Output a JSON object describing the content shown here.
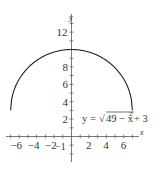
{
  "chart_data": {
    "type": "line",
    "title": "",
    "xlabel": "x",
    "ylabel": "y",
    "equation": "y = √(49 − x²) + 3",
    "equation_parts": {
      "lhs": "y = ",
      "radicand": "49 − x",
      "exp": "2",
      "rhs": " + 3"
    },
    "xlim": [
      -7.5,
      7.8
    ],
    "ylim": [
      -2.7,
      14
    ],
    "x_ticks": [
      -6,
      -4,
      -2,
      2,
      4,
      6
    ],
    "x_tick_labels": [
      "−6",
      "−4",
      "−2",
      "2",
      "4",
      "6"
    ],
    "y_ticks": [
      2,
      4,
      6,
      8,
      12
    ],
    "y_tick_labels": [
      "2",
      "4",
      "6",
      "8",
      "12"
    ],
    "origin_label": "−1",
    "grid": false,
    "series": [
      {
        "name": "y = sqrt(49 - x^2) + 3",
        "x": [
          -7,
          -6,
          -4,
          -2,
          0,
          2,
          4,
          6,
          7
        ],
        "y": [
          3,
          6.61,
          8.74,
          9.71,
          10,
          9.71,
          8.74,
          6.61,
          3
        ]
      }
    ]
  }
}
